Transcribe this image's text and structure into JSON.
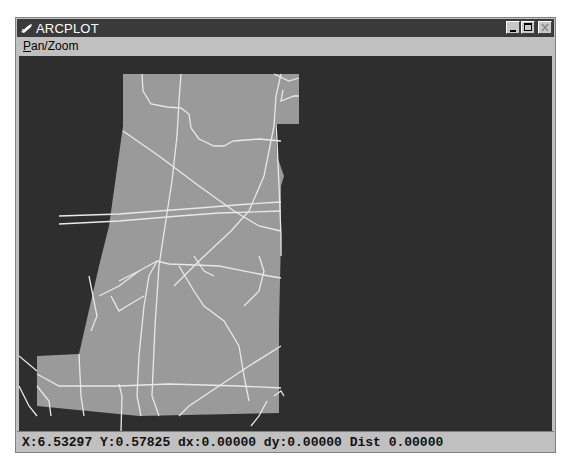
{
  "window": {
    "title": "ARCPLOT",
    "controls": [
      "minimize",
      "maximize",
      "close"
    ]
  },
  "menubar": {
    "items": [
      {
        "label": "Pan/Zoom",
        "mnemonic": "P",
        "rest": "an/Zoom"
      }
    ]
  },
  "canvas": {
    "background": "#2e2e2e",
    "polygon_fill": "#9a9a9a",
    "road_color": "#e8e8e8"
  },
  "statusbar": {
    "text": "X:6.53297 Y:0.57825 dx:0.00000 dy:0.00000 Dist 0.00000",
    "x": "6.53297",
    "y": "0.57825",
    "dx": "0.00000",
    "dy": "0.00000",
    "dist": "0.00000"
  }
}
